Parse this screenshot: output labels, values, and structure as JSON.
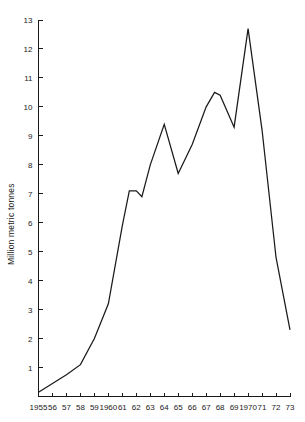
{
  "chart_data": {
    "type": "line",
    "title": "",
    "subtitle": "",
    "xlabel": "",
    "ylabel": "Million metric tonnes",
    "xlim": [
      1955,
      1973
    ],
    "ylim": [
      0,
      13
    ],
    "grid": false,
    "legend": null,
    "y_ticks": [
      0,
      1,
      2,
      3,
      4,
      5,
      6,
      7,
      8,
      9,
      10,
      11,
      12,
      13
    ],
    "y_tick_labels": [
      "0",
      "1",
      "2",
      "3",
      "4",
      "5",
      "6",
      "7",
      "8",
      "9",
      "10",
      "11",
      "12",
      "13"
    ],
    "y_tick_labels_shown": [
      "1",
      "2",
      "3",
      "4",
      "5",
      "6",
      "7",
      "8",
      "9",
      "10",
      "11",
      "12",
      "13"
    ],
    "x_ticks": [
      1955,
      1956,
      1957,
      1958,
      1959,
      1960,
      1961,
      1962,
      1963,
      1964,
      1965,
      1966,
      1967,
      1968,
      1969,
      1970,
      1971,
      1972,
      1973
    ],
    "x_tick_labels": [
      "1955",
      "56",
      "57",
      "58",
      "59",
      "1960",
      "61",
      "62",
      "63",
      "64",
      "65",
      "66",
      "67",
      "68",
      "69",
      "1970",
      "71",
      "72",
      "73"
    ],
    "series": [
      {
        "name": "production",
        "color": "#1a1a1a",
        "x": [
          1955,
          1956,
          1957,
          1958,
          1959,
          1960,
          1961,
          1961.5,
          1962,
          1962.4,
          1963,
          1964,
          1965,
          1966,
          1967,
          1967.6,
          1968,
          1969,
          1970,
          1971,
          1972,
          1973
        ],
        "values": [
          0.15,
          0.45,
          0.75,
          1.1,
          2.0,
          3.2,
          5.9,
          7.1,
          7.1,
          6.9,
          8.0,
          9.4,
          7.7,
          8.7,
          10.0,
          10.5,
          10.4,
          9.3,
          12.7,
          9.2,
          4.8,
          2.3
        ]
      }
    ],
    "annotations": []
  },
  "axis": {
    "y_axis_title": "Million metric tonnes"
  }
}
